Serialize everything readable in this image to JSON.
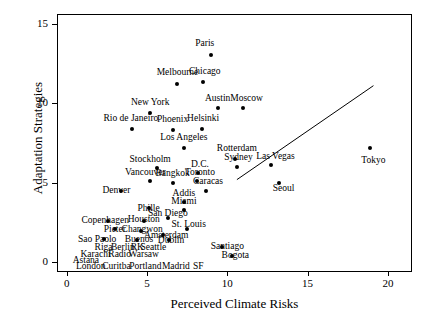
{
  "chart_data": {
    "type": "scatter",
    "title": "",
    "xlabel": "Perceived Climate Risks",
    "ylabel": "Adaptation Strategies",
    "xlim": [
      -0.6,
      21.5
    ],
    "ylim": [
      -0.6,
      15.6
    ],
    "xticks": [
      0,
      5,
      10,
      15,
      20
    ],
    "yticks": [
      0,
      5,
      10,
      15
    ],
    "grid": false,
    "legend": null,
    "trendline": {
      "x0": 10.6,
      "y0": 5.2,
      "x1": 19.1,
      "y1": 11.1
    },
    "points": [
      {
        "label": "Paris",
        "x": 9.0,
        "y": 13.0,
        "lx": 8.6,
        "ly": 13.75,
        "anchor": "center"
      },
      {
        "label": "Melbourne",
        "x": 6.9,
        "y": 11.2,
        "lx": 6.9,
        "ly": 11.95,
        "anchor": "center"
      },
      {
        "label": "Chicago",
        "x": 8.5,
        "y": 11.3,
        "lx": 8.6,
        "ly": 12.05,
        "anchor": "center"
      },
      {
        "label": "Austin",
        "x": 9.4,
        "y": 9.7,
        "lx": 9.4,
        "ly": 10.35,
        "anchor": "center"
      },
      {
        "label": "Moscow",
        "x": 11.0,
        "y": 9.7,
        "lx": 11.2,
        "ly": 10.35,
        "anchor": "center"
      },
      {
        "label": "New York",
        "x": 5.2,
        "y": 9.4,
        "lx": 5.2,
        "ly": 10.1,
        "anchor": "center"
      },
      {
        "label": "Rio de Janeiro",
        "x": 4.1,
        "y": 8.4,
        "lx": 4.0,
        "ly": 9.1,
        "anchor": "center"
      },
      {
        "label": "Phoenix",
        "x": 6.6,
        "y": 8.3,
        "lx": 6.6,
        "ly": 9.0,
        "anchor": "center"
      },
      {
        "label": "Helsinki",
        "x": 8.4,
        "y": 8.4,
        "lx": 8.5,
        "ly": 9.05,
        "anchor": "center"
      },
      {
        "label": "Tokyo",
        "x": 18.9,
        "y": 7.2,
        "lx": 19.1,
        "ly": 6.45,
        "anchor": "center"
      },
      {
        "label": "Los Angeles",
        "x": 7.3,
        "y": 7.2,
        "lx": 7.3,
        "ly": 7.85,
        "anchor": "center"
      },
      {
        "label": "Rotterdam",
        "x": 10.5,
        "y": 6.5,
        "lx": 10.6,
        "ly": 7.2,
        "anchor": "center"
      },
      {
        "label": "Sydney",
        "x": 10.6,
        "y": 6.0,
        "lx": 10.7,
        "ly": 6.6,
        "anchor": "center"
      },
      {
        "label": "Las Vegas",
        "x": 12.7,
        "y": 6.1,
        "lx": 13.0,
        "ly": 6.7,
        "anchor": "center"
      },
      {
        "label": "Stockholm",
        "x": 5.6,
        "y": 5.9,
        "lx": 5.2,
        "ly": 6.5,
        "anchor": "center"
      },
      {
        "label": "D.C.",
        "x": 8.2,
        "y": 5.6,
        "lx": 8.3,
        "ly": 6.2,
        "anchor": "center"
      },
      {
        "label": "Toronto",
        "x": 8.1,
        "y": 5.1,
        "lx": 8.3,
        "ly": 5.7,
        "anchor": "center"
      },
      {
        "label": "Vancouver",
        "x": 5.2,
        "y": 5.1,
        "lx": 4.9,
        "ly": 5.65,
        "anchor": "center"
      },
      {
        "label": "Bangkok",
        "x": 6.6,
        "y": 5.0,
        "lx": 6.6,
        "ly": 5.6,
        "anchor": "center"
      },
      {
        "label": "Caracas",
        "x": 8.7,
        "y": 4.5,
        "lx": 8.8,
        "ly": 5.1,
        "anchor": "center"
      },
      {
        "label": "Seoul",
        "x": 13.2,
        "y": 5.0,
        "lx": 13.5,
        "ly": 4.7,
        "anchor": "center"
      },
      {
        "label": "Denver",
        "x": 3.4,
        "y": 4.5,
        "lx": 3.1,
        "ly": 4.55,
        "anchor": "center"
      },
      {
        "label": "Addis",
        "x": 7.3,
        "y": 3.8,
        "lx": 7.3,
        "ly": 4.35,
        "anchor": "center"
      },
      {
        "label": "Miami",
        "x": 7.3,
        "y": 3.3,
        "lx": 7.3,
        "ly": 3.85,
        "anchor": "center"
      },
      {
        "label": "Phille",
        "x": 5.1,
        "y": 3.4,
        "lx": 5.1,
        "ly": 3.4,
        "anchor": "center"
      },
      {
        "label": "San Diego",
        "x": 6.3,
        "y": 2.8,
        "lx": 6.3,
        "ly": 3.1,
        "anchor": "center"
      },
      {
        "label": "Copenhagen",
        "x": 2.6,
        "y": 2.6,
        "lx": 2.4,
        "ly": 2.65,
        "anchor": "center"
      },
      {
        "label": "Houston",
        "x": 4.8,
        "y": 2.6,
        "lx": 4.8,
        "ly": 2.7,
        "anchor": "center"
      },
      {
        "label": "Pieter",
        "x": 3.0,
        "y": 2.1,
        "lx": 3.0,
        "ly": 2.1,
        "anchor": "center"
      },
      {
        "label": "Changwon",
        "x": 4.6,
        "y": 2.0,
        "lx": 4.7,
        "ly": 2.1,
        "anchor": "center"
      },
      {
        "label": "Amsterdam",
        "x": 6.0,
        "y": 1.7,
        "lx": 6.2,
        "ly": 1.75,
        "anchor": "center"
      },
      {
        "label": "St. Louis",
        "x": 7.5,
        "y": 2.1,
        "lx": 7.6,
        "ly": 2.4,
        "anchor": "center"
      },
      {
        "label": "Sao Paolo",
        "x": 2.3,
        "y": 1.5,
        "lx": 1.9,
        "ly": 1.5,
        "anchor": "center"
      },
      {
        "label": "Buenos",
        "x": 4.4,
        "y": 1.4,
        "lx": 4.5,
        "ly": 1.45,
        "anchor": "center"
      },
      {
        "label": "Dublin",
        "x": 6.4,
        "y": 1.4,
        "lx": 6.5,
        "ly": 1.4,
        "anchor": "center"
      },
      {
        "label": "Santiago",
        "x": 9.7,
        "y": 1.0,
        "lx": 10.0,
        "ly": 1.05,
        "anchor": "center"
      },
      {
        "label": "Riga",
        "x": 2.6,
        "y": 0.95,
        "lx": 2.3,
        "ly": 0.95,
        "anchor": "center"
      },
      {
        "label": "Berlin",
        "x": 3.6,
        "y": 0.95,
        "lx": 3.5,
        "ly": 0.95,
        "anchor": "center"
      },
      {
        "label": "RK",
        "x": 4.5,
        "y": 0.95,
        "lx": 4.4,
        "ly": 0.95,
        "anchor": "center"
      },
      {
        "label": "Seattle",
        "x": 5.4,
        "y": 0.95,
        "lx": 5.4,
        "ly": 0.95,
        "anchor": "center"
      },
      {
        "label": "Karachi",
        "x": 2.1,
        "y": 0.5,
        "lx": 1.8,
        "ly": 0.5,
        "anchor": "center"
      },
      {
        "label": "Radio",
        "x": 3.4,
        "y": 0.5,
        "lx": 3.3,
        "ly": 0.5,
        "anchor": "center"
      },
      {
        "label": "Warsaw",
        "x": 4.7,
        "y": 0.5,
        "lx": 4.8,
        "ly": 0.5,
        "anchor": "center"
      },
      {
        "label": "Bogota",
        "x": 10.3,
        "y": 0.4,
        "lx": 10.5,
        "ly": 0.45,
        "anchor": "center"
      },
      {
        "label": "Astana",
        "x": 1.5,
        "y": 0.1,
        "lx": 1.2,
        "ly": 0.15,
        "anchor": "center"
      },
      {
        "label": "London",
        "x": 1.7,
        "y": -0.25,
        "lx": 1.5,
        "ly": -0.25,
        "anchor": "center"
      },
      {
        "label": "Curitba",
        "x": 3.2,
        "y": -0.25,
        "lx": 3.1,
        "ly": -0.25,
        "anchor": "center"
      },
      {
        "label": "Portland",
        "x": 4.9,
        "y": -0.25,
        "lx": 4.9,
        "ly": -0.25,
        "anchor": "center"
      },
      {
        "label": "Madrid",
        "x": 6.8,
        "y": -0.25,
        "lx": 6.8,
        "ly": -0.25,
        "anchor": "center"
      },
      {
        "label": "SF",
        "x": 8.2,
        "y": -0.25,
        "lx": 8.2,
        "ly": -0.25,
        "anchor": "center"
      },
      {
        "label": "Bogota2",
        "x": 10.2,
        "y": 0.0,
        "lx": 10.2,
        "ly": 0.0,
        "anchor": "hidden"
      }
    ],
    "markers_only": [
      {
        "x": 9.0,
        "y": 13.0
      },
      {
        "x": 6.9,
        "y": 11.2
      },
      {
        "x": 8.5,
        "y": 11.3
      },
      {
        "x": 9.4,
        "y": 9.7
      },
      {
        "x": 11.0,
        "y": 9.7
      },
      {
        "x": 5.2,
        "y": 9.4
      },
      {
        "x": 4.1,
        "y": 8.4
      },
      {
        "x": 6.6,
        "y": 8.3
      },
      {
        "x": 8.4,
        "y": 8.4
      },
      {
        "x": 18.9,
        "y": 7.2
      },
      {
        "x": 7.3,
        "y": 7.2
      },
      {
        "x": 10.5,
        "y": 6.5
      },
      {
        "x": 10.6,
        "y": 6.0
      },
      {
        "x": 12.7,
        "y": 6.1
      },
      {
        "x": 5.6,
        "y": 5.9
      },
      {
        "x": 8.2,
        "y": 5.6
      },
      {
        "x": 8.1,
        "y": 5.1
      },
      {
        "x": 5.2,
        "y": 5.1
      },
      {
        "x": 6.6,
        "y": 5.0
      },
      {
        "x": 8.7,
        "y": 4.5
      },
      {
        "x": 13.2,
        "y": 5.0
      },
      {
        "x": 3.4,
        "y": 4.5
      },
      {
        "x": 7.3,
        "y": 3.8
      },
      {
        "x": 7.3,
        "y": 3.3
      },
      {
        "x": 5.1,
        "y": 3.4
      },
      {
        "x": 6.3,
        "y": 2.8
      },
      {
        "x": 2.6,
        "y": 2.6
      },
      {
        "x": 4.8,
        "y": 2.6
      },
      {
        "x": 3.0,
        "y": 2.1
      },
      {
        "x": 4.6,
        "y": 2.0
      },
      {
        "x": 6.0,
        "y": 1.7
      },
      {
        "x": 7.5,
        "y": 2.1
      },
      {
        "x": 2.3,
        "y": 1.5
      },
      {
        "x": 4.4,
        "y": 1.4
      },
      {
        "x": 6.4,
        "y": 1.4
      },
      {
        "x": 9.7,
        "y": 1.0
      },
      {
        "x": 10.3,
        "y": 0.4
      }
    ]
  },
  "axes": {
    "x_title": "Perceived Climate Risks",
    "y_title": "Adaptation Strategies",
    "x_ticklabels": [
      "0",
      "5",
      "10",
      "15",
      "20"
    ],
    "y_ticklabels": [
      "0",
      "5",
      "10",
      "15"
    ]
  }
}
